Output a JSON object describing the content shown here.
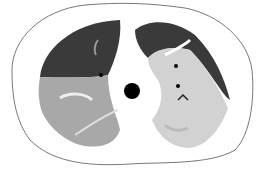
{
  "image": {
    "description": "Axial chest CT illustration showing body outline, two lungs with dark upper and lighter lower regions, and a central black circle (airway)",
    "colors": {
      "background": "#ffffff",
      "body_outline": "#555555",
      "lung_dark": "#3a3a3a",
      "lung_mid": "#a8a8a8",
      "lung_light": "#d2d2d2",
      "airway": "#000000"
    }
  }
}
